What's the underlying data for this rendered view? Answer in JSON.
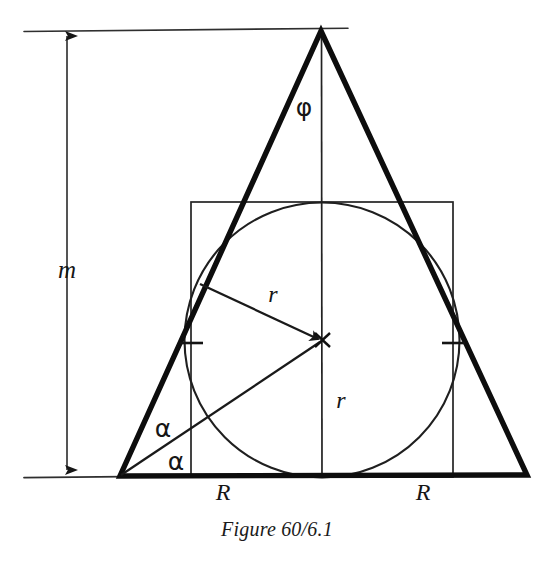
{
  "figure": {
    "caption": "Figure 60/6.1",
    "labels": {
      "height_m": "m",
      "apex_angle_phi": "φ",
      "radius_upper_r": "r",
      "radius_lower_r": "r",
      "base_half_left_R": "R",
      "base_half_right_R": "R",
      "angle_alpha_upper": "α",
      "angle_alpha_lower": "α"
    },
    "colors": {
      "ink": "#161616",
      "thin_ink": "#2a2a2a",
      "background": "#ffffff"
    },
    "geometry": {
      "apex": [
        321,
        31
      ],
      "base_left": [
        120,
        476
      ],
      "base_right": [
        527,
        475
      ],
      "incircle_center": [
        322,
        340
      ],
      "incircle_radius": 136,
      "square": {
        "left": 191,
        "top": 202,
        "right": 453,
        "bottom": 477
      },
      "baseline_y": 477,
      "top_reference_line_y": 30,
      "dimension_line_x": 67
    }
  }
}
